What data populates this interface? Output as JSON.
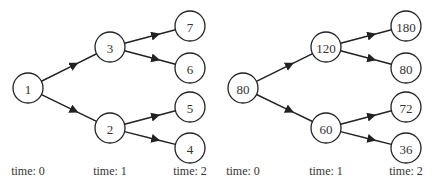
{
  "trees": [
    {
      "name": "index-tree",
      "nodes": [
        {
          "id": "a",
          "label": "1",
          "x": 28,
          "y": 88
        },
        {
          "id": "b",
          "label": "3",
          "x": 110,
          "y": 47
        },
        {
          "id": "c",
          "label": "2",
          "x": 110,
          "y": 128
        },
        {
          "id": "d",
          "label": "7",
          "x": 190,
          "y": 26
        },
        {
          "id": "e",
          "label": "6",
          "x": 190,
          "y": 68
        },
        {
          "id": "f",
          "label": "5",
          "x": 190,
          "y": 107
        },
        {
          "id": "g",
          "label": "4",
          "x": 190,
          "y": 148
        }
      ],
      "edges": [
        [
          "a",
          "b"
        ],
        [
          "a",
          "c"
        ],
        [
          "b",
          "d"
        ],
        [
          "b",
          "e"
        ],
        [
          "c",
          "f"
        ],
        [
          "c",
          "g"
        ]
      ],
      "time_labels": [
        {
          "text": "time: 0",
          "x": 28
        },
        {
          "text": "time: 1",
          "x": 110
        },
        {
          "text": "time: 2",
          "x": 190
        }
      ]
    },
    {
      "name": "value-tree",
      "nodes": [
        {
          "id": "a",
          "label": "80",
          "x": 243,
          "y": 88
        },
        {
          "id": "b",
          "label": "120",
          "x": 326,
          "y": 47
        },
        {
          "id": "c",
          "label": "60",
          "x": 326,
          "y": 128
        },
        {
          "id": "d",
          "label": "180",
          "x": 406,
          "y": 26
        },
        {
          "id": "e",
          "label": "80",
          "x": 406,
          "y": 68
        },
        {
          "id": "f",
          "label": "72",
          "x": 406,
          "y": 107
        },
        {
          "id": "g",
          "label": "36",
          "x": 406,
          "y": 148
        }
      ],
      "edges": [
        [
          "a",
          "b"
        ],
        [
          "a",
          "c"
        ],
        [
          "b",
          "d"
        ],
        [
          "b",
          "e"
        ],
        [
          "c",
          "f"
        ],
        [
          "c",
          "g"
        ]
      ],
      "time_labels": [
        {
          "text": "time: 0",
          "x": 243
        },
        {
          "text": "time: 1",
          "x": 326
        },
        {
          "text": "time: 2",
          "x": 406
        }
      ]
    }
  ],
  "style": {
    "node_radius": 15,
    "label_y": 172,
    "stroke_color": "#222222",
    "text_color": "#333333"
  }
}
